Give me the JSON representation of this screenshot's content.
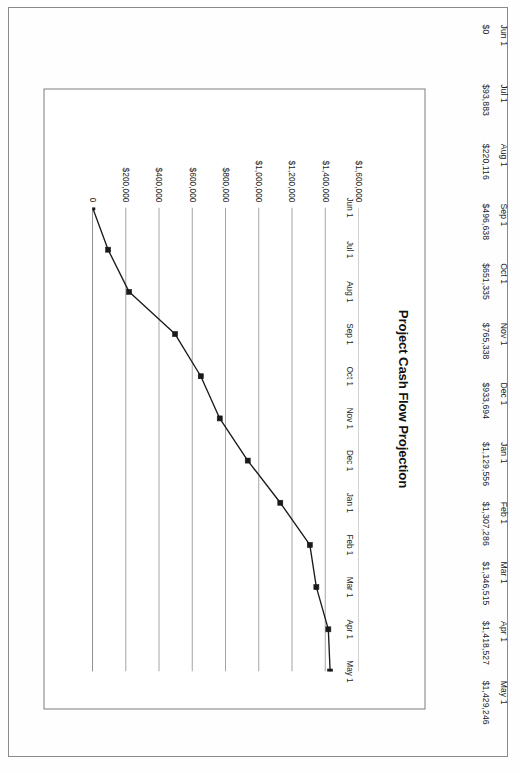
{
  "document": {
    "kind": "scanned-page",
    "orientation_note": "landscape-content"
  },
  "table": {
    "dates": [
      "Jun 1",
      "Jul 1",
      "Aug 1",
      "Sep 1",
      "Oct 1",
      "Nov 1",
      "Dec 1",
      "Jan 1",
      "Feb 1",
      "Mar 1",
      "Apr 1",
      "May 1"
    ],
    "values": [
      "$0",
      "$93,883",
      "$220,116",
      "$496,638",
      "$651,335",
      "$765,338",
      "$933,694",
      "$1,129,556",
      "$1,307,286",
      "$1,346,515",
      "$1,418,527",
      "$1,429,246"
    ]
  },
  "chart": {
    "title": "Project Cash Flow Projection"
  },
  "chart_data": {
    "type": "line",
    "title": "Project Cash Flow Projection",
    "xlabel": "",
    "ylabel": "",
    "categories": [
      "Jun 1",
      "Jul 1",
      "Aug 1",
      "Sep 1",
      "Oct 1",
      "Nov 1",
      "Dec 1",
      "Jan 1",
      "Feb 1",
      "Mar 1",
      "Apr 1",
      "May 1"
    ],
    "values": [
      0,
      93883,
      220116,
      496638,
      651335,
      765338,
      933694,
      1129556,
      1307286,
      1346515,
      1418527,
      1429246
    ],
    "ylim": [
      0,
      1600000
    ],
    "ytick_values": [
      0,
      200000,
      400000,
      600000,
      800000,
      1000000,
      1200000,
      1400000,
      1600000
    ],
    "ytick_labels": [
      "0",
      "$200,000",
      "$400,000",
      "$600,000",
      "$800,000",
      "$1,000,000",
      "$1,200,000",
      "$1,400,000",
      "$1,600,000"
    ],
    "grid": "horizontal-value-gridlines",
    "legend": "none",
    "marker": "square",
    "line_color": "#1a1a1a",
    "marker_color": "#1a1a1a",
    "gridline_color": "#9a9a9a",
    "axis_color": "#6e6e6e"
  }
}
